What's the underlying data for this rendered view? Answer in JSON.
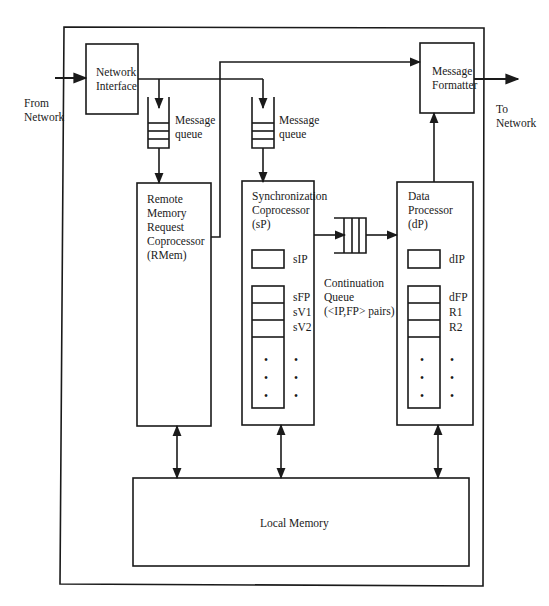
{
  "external": {
    "from_network": "From\nNetwork",
    "to_network": "To\nNetwork"
  },
  "blocks": {
    "network_interface": "Network\nInterface",
    "message_formatter": "Message\nFormatter",
    "rmem": "Remote\nMemory\nRequest\nCoprocessor\n(RMem)",
    "sp": "Synchronization\nCoprocessor\n(sP)",
    "dp": "Data\nProcessor\n(dP)",
    "local_memory": "Local Memory"
  },
  "queues": {
    "rmem_queue": "Message\nqueue",
    "sp_queue": "Message\nqueue",
    "continuation_queue": "Continuation\nQueue\n(<IP,FP> pairs)"
  },
  "registers": {
    "sp": {
      "ip": "sIP",
      "fp": "sFP",
      "v1": "sV1",
      "v2": "sV2",
      "dots": "•\n•\n•"
    },
    "dp": {
      "ip": "dIP",
      "fp": "dFP",
      "r1": "R1",
      "r2": "R2",
      "dots": "•\n•\n•"
    }
  }
}
